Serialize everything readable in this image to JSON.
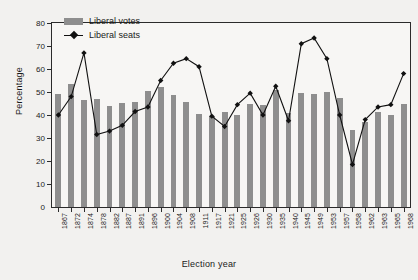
{
  "chart_data": {
    "type": "bar",
    "title": "",
    "xlabel": "Election year",
    "ylabel": "Percentage",
    "ylim": [
      0,
      80
    ],
    "ytick_values": [
      0,
      10,
      20,
      30,
      40,
      50,
      60,
      70,
      80
    ],
    "grid": false,
    "legend_position": "top-left",
    "categories": [
      "1867",
      "1872",
      "1874",
      "1878",
      "1882",
      "1887",
      "1891",
      "1896",
      "1900",
      "1904",
      "1908",
      "1911",
      "1917",
      "1921",
      "1925",
      "1926",
      "1930",
      "1935",
      "1940",
      "1945",
      "1949",
      "1953",
      "1957",
      "1958",
      "1962",
      "1963",
      "1965",
      "1968"
    ],
    "series": [
      {
        "name": "Liberal votes",
        "type": "bar",
        "color": "#8e8e8e",
        "values": [
          49,
          53.5,
          46.5,
          46.8,
          44,
          45.2,
          45.5,
          50.5,
          52,
          48.5,
          45.5,
          40.5,
          39.5,
          41.5,
          40,
          45,
          44.5,
          51,
          41,
          49.5,
          49,
          50.2,
          47.5,
          33.5,
          37,
          41.5,
          40.2,
          45
        ]
      },
      {
        "name": "Liberal seats",
        "type": "line",
        "color": "#111111",
        "marker": "diamond",
        "values": [
          40,
          48,
          67,
          31.5,
          33,
          35.5,
          41.5,
          43.5,
          55,
          62.5,
          64.5,
          61,
          39.5,
          35,
          44.5,
          49.5,
          40,
          52.5,
          37.5,
          71,
          73.5,
          64.5,
          40,
          18.5,
          38,
          43.5,
          44.5,
          58
        ]
      }
    ]
  },
  "legend": {
    "items": [
      {
        "label": "Liberal votes",
        "marker": "bar-swatch"
      },
      {
        "label": "Liberal seats",
        "marker": "line-diamond"
      }
    ]
  },
  "axes": {
    "y_title": "Percentage",
    "x_title": "Election year"
  }
}
